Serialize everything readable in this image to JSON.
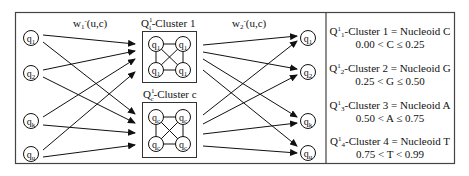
{
  "diagram": {
    "weight_labels": {
      "w1": {
        "base": "w",
        "sub": "1",
        "sup": "-",
        "args": "(u,c)"
      },
      "w2": {
        "base": "w",
        "sub": "2",
        "sup": "-",
        "args": "(u,c)"
      }
    },
    "input_nodes": [
      {
        "label": "q",
        "sub": "1"
      },
      {
        "label": "q",
        "sub": "2"
      },
      {
        "label": "q",
        "sub": "k"
      },
      {
        "label": "q",
        "sub": "u"
      }
    ],
    "output_nodes": [
      {
        "label": "q",
        "sub": "1"
      },
      {
        "label": "q",
        "sub": "2"
      },
      {
        "label": "q",
        "sub": "k"
      },
      {
        "label": "q",
        "sub": "u"
      }
    ],
    "clusters": [
      {
        "title_base": "Q",
        "title_sup": "1",
        "title_sub": "1",
        "title_rest": "-Cluster 1",
        "node_sub": "1"
      },
      {
        "title_base": "Q",
        "title_sup": "1",
        "title_sub": "c",
        "title_rest": "-Cluster c",
        "node_sub": "c"
      }
    ]
  },
  "legend": [
    {
      "base": "Q",
      "sup": "1",
      "sub": "1",
      "text": "-Cluster 1 = Nucleoid C",
      "range": "0.00 < C ≤ 0.25"
    },
    {
      "base": "Q",
      "sup": "1",
      "sub": "2",
      "text": "-Cluster 2 = Nucleoid G",
      "range": "0.25 < G ≤ 0.50"
    },
    {
      "base": "Q",
      "sup": "1",
      "sub": "3",
      "text": "-Cluster 3 = Nucleoid A",
      "range": "0.50 < A ≤ 0.75"
    },
    {
      "base": "Q",
      "sup": "1",
      "sub": "4",
      "text": "-Cluster 4 = Nucleoid T",
      "range": "0.75 < T < 0.99"
    }
  ],
  "colors": {
    "stroke": "#1a1a1a",
    "background": "#ffffff",
    "frame": "#444444"
  }
}
